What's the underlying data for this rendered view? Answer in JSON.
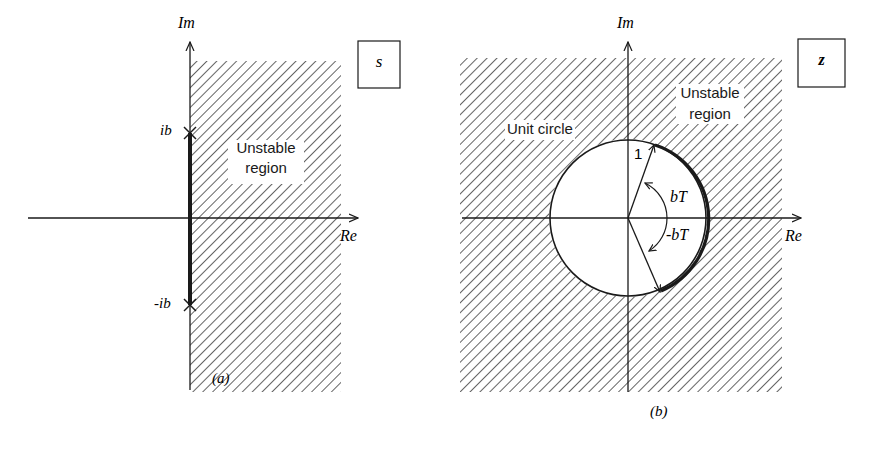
{
  "panel_a": {
    "plane_label": "s",
    "im_label": "Im",
    "re_label": "Re",
    "upper_pole_label": "ib",
    "lower_pole_label": "-ib",
    "region_line1": "Unstable",
    "region_line2": "region",
    "caption": "(a)"
  },
  "panel_b": {
    "plane_label": "z",
    "im_label": "Im",
    "re_label": "Re",
    "circle_label": "Unit circle",
    "radius_label": "1",
    "angle_pos_label": "bT",
    "angle_neg_label": "-bT",
    "region_line1": "Unstable",
    "region_line2": "region",
    "caption": "(b)"
  },
  "colors": {
    "ink": "#1a1a1a",
    "background": "#ffffff"
  }
}
